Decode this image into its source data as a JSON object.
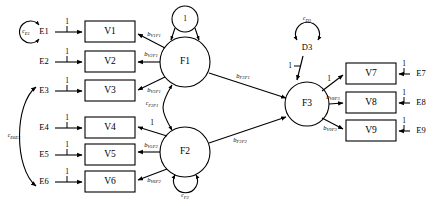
{
  "diagram": {
    "type": "structural-equation-model-path-diagram",
    "title": "",
    "observed_variables": [
      {
        "id": "V1",
        "label": "V1",
        "x": 110,
        "y": 32
      },
      {
        "id": "V2",
        "label": "V2",
        "x": 110,
        "y": 62
      },
      {
        "id": "V3",
        "label": "V3",
        "x": 110,
        "y": 91
      },
      {
        "id": "V4",
        "label": "V4",
        "x": 110,
        "y": 128
      },
      {
        "id": "V5",
        "label": "V5",
        "x": 110,
        "y": 155
      },
      {
        "id": "V6",
        "label": "V6",
        "x": 110,
        "y": 182
      },
      {
        "id": "V7",
        "label": "V7",
        "x": 371,
        "y": 74
      },
      {
        "id": "V8",
        "label": "V8",
        "x": 371,
        "y": 103
      },
      {
        "id": "V9",
        "label": "V9",
        "x": 371,
        "y": 131
      }
    ],
    "error_terms": [
      {
        "id": "E1",
        "label": "E1",
        "x": 44,
        "y": 32
      },
      {
        "id": "E2",
        "label": "E2",
        "x": 44,
        "y": 62
      },
      {
        "id": "E3",
        "label": "E3",
        "x": 44,
        "y": 91
      },
      {
        "id": "E4",
        "label": "E4",
        "x": 44,
        "y": 128
      },
      {
        "id": "E5",
        "label": "E5",
        "x": 44,
        "y": 155
      },
      {
        "id": "E6",
        "label": "E6",
        "x": 44,
        "y": 182
      },
      {
        "id": "E7",
        "label": "E7",
        "x": 421,
        "y": 74
      },
      {
        "id": "E8",
        "label": "E8",
        "x": 421,
        "y": 103
      },
      {
        "id": "E9",
        "label": "E9",
        "x": 421,
        "y": 131
      }
    ],
    "latent_factors": [
      {
        "id": "F1",
        "label": "F1",
        "x": 185,
        "y": 62
      },
      {
        "id": "F2",
        "label": "F2",
        "x": 185,
        "y": 152
      },
      {
        "id": "F3",
        "label": "F3",
        "x": 307,
        "y": 104
      }
    ],
    "disturbances": [
      {
        "id": "D3",
        "label": "D3",
        "x": 307,
        "y": 48
      }
    ],
    "unit_circles": [
      {
        "id": "F1-unit",
        "label": "1",
        "x": 185,
        "y": 19
      }
    ],
    "factor_loadings": [
      {
        "from": "F1",
        "to": "V1",
        "label": "b",
        "subscript": "V1F1"
      },
      {
        "from": "F1",
        "to": "V2",
        "label": "b",
        "subscript": "V2F1"
      },
      {
        "from": "F1",
        "to": "V3",
        "label": "b",
        "subscript": "V3F1"
      },
      {
        "from": "F2",
        "to": "V4",
        "label": "1",
        "subscript": ""
      },
      {
        "from": "F2",
        "to": "V5",
        "label": "b",
        "subscript": "V5F2"
      },
      {
        "from": "F2",
        "to": "V6",
        "label": "b",
        "subscript": "V6F2"
      },
      {
        "from": "F3",
        "to": "V7",
        "label": "1",
        "subscript": ""
      },
      {
        "from": "F3",
        "to": "V8",
        "label": "b",
        "subscript": "V8F3"
      },
      {
        "from": "F3",
        "to": "V9",
        "label": "b",
        "subscript": "V9F3"
      }
    ],
    "structural_paths": [
      {
        "from": "F1",
        "to": "F3",
        "label": "b",
        "subscript": "F3F1"
      },
      {
        "from": "F2",
        "to": "F3",
        "label": "b",
        "subscript": "F3F2"
      },
      {
        "from": "D3",
        "to": "F3",
        "label": "1",
        "subscript": ""
      }
    ],
    "error_paths": [
      {
        "from": "E1",
        "to": "V1",
        "label": "1"
      },
      {
        "from": "E2",
        "to": "V2",
        "label": "1"
      },
      {
        "from": "E3",
        "to": "V3",
        "label": "1"
      },
      {
        "from": "E4",
        "to": "V4",
        "label": "1"
      },
      {
        "from": "E5",
        "to": "V5",
        "label": "1"
      },
      {
        "from": "E6",
        "to": "V6",
        "label": "1"
      },
      {
        "from": "E7",
        "to": "V7",
        "label": "1"
      },
      {
        "from": "E8",
        "to": "V8",
        "label": "1"
      },
      {
        "from": "E9",
        "to": "V9",
        "label": "1"
      }
    ],
    "variances": [
      {
        "id": "var-E1",
        "on": "E1",
        "label": "c",
        "subscript": "E1"
      },
      {
        "id": "var-F2",
        "on": "F2",
        "label": "c",
        "subscript": "F2"
      },
      {
        "id": "var-D3",
        "on": "D3",
        "label": "c",
        "subscript": "D3"
      }
    ],
    "covariances": [
      {
        "id": "cov-F2F1",
        "between": [
          "F1",
          "F2"
        ],
        "label": "c",
        "subscript": "F2F1"
      },
      {
        "id": "cov-E6E3",
        "between": [
          "E3",
          "E6"
        ],
        "label": "c",
        "subscript": "E6E3"
      }
    ],
    "colors": {
      "stroke": "#000000",
      "fill": "#ffffff",
      "background": "#ffffff"
    }
  }
}
